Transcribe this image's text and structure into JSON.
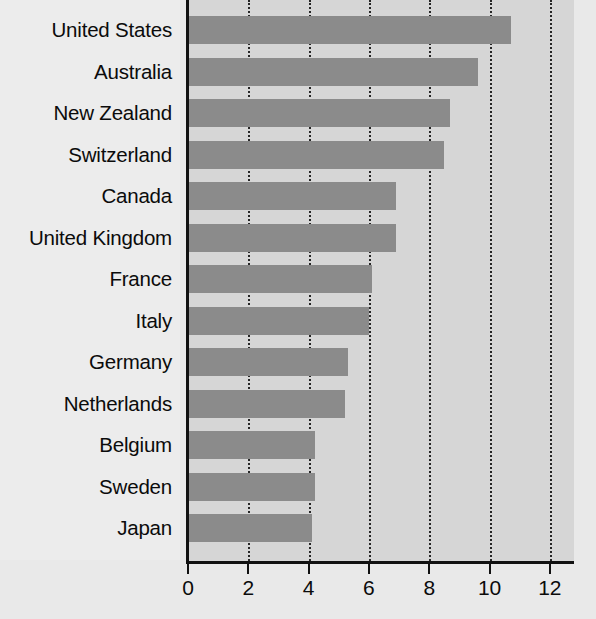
{
  "chart_data": {
    "type": "bar",
    "orientation": "horizontal",
    "title": "",
    "subtitle": "",
    "xlabel": "",
    "ylabel": "",
    "categories": [
      "United States",
      "Australia",
      "New Zealand",
      "Switzerland",
      "Canada",
      "United Kingdom",
      "France",
      "Italy",
      "Germany",
      "Netherlands",
      "Belgium",
      "Sweden",
      "Japan"
    ],
    "values": [
      10.7,
      9.6,
      8.7,
      8.5,
      6.9,
      6.9,
      6.1,
      6.0,
      5.3,
      5.2,
      4.2,
      4.2,
      4.1
    ],
    "xlim": [
      0,
      12.8
    ],
    "xticks": [
      0,
      2,
      4,
      6,
      8,
      10,
      12
    ],
    "xtick_labels": [
      "0",
      "2",
      "4",
      "6",
      "8",
      "10",
      "12"
    ],
    "grid": {
      "vertical": true,
      "horizontal": false,
      "style": "dotted"
    },
    "legend": {
      "visible": false,
      "position": "none",
      "entries": []
    },
    "annotations": [],
    "colors": {
      "bar_fill": "#8b8b8b",
      "plot_background": "#d6d6d6",
      "figure_background": "#e9e9e9",
      "axis_line": "#111111",
      "gridline": "#262626",
      "text": "#0b0b0b"
    }
  }
}
